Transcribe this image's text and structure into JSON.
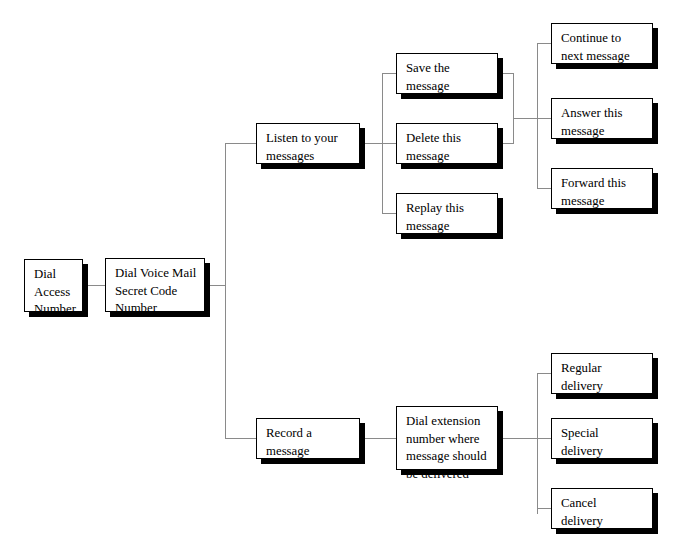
{
  "diagram": {
    "type": "flowchart",
    "orientation": "left-to-right",
    "box_fill_color": "#ffffff",
    "box_border_color": "#000000",
    "shadow_color": "#000000",
    "connector_color": "#8a8a8a",
    "text_color": "#000000"
  },
  "nodes": [
    {
      "id": "dial-access-number",
      "label": "Dial\nAccess\nNumber",
      "x": 24,
      "y": 259,
      "w": 59,
      "h": 53,
      "level": 0
    },
    {
      "id": "dial-secret-code",
      "label": "Dial Voice Mail\nSecret Code\nNumber",
      "x": 105,
      "y": 258,
      "w": 100,
      "h": 54,
      "level": 1
    },
    {
      "id": "listen-messages",
      "label": "Listen to your\nmessages",
      "x": 256,
      "y": 123,
      "w": 104,
      "h": 41,
      "level": 2
    },
    {
      "id": "record-message",
      "label": "Record a\nmessage",
      "x": 256,
      "y": 418,
      "w": 104,
      "h": 41,
      "level": 2
    },
    {
      "id": "save-message",
      "label": "Save the\nmessage",
      "x": 396,
      "y": 53,
      "w": 102,
      "h": 41,
      "level": 3
    },
    {
      "id": "delete-message",
      "label": "Delete this\nmessage",
      "x": 396,
      "y": 123,
      "w": 102,
      "h": 41,
      "level": 3
    },
    {
      "id": "replay-message",
      "label": "Replay this\nmessage",
      "x": 396,
      "y": 193,
      "w": 102,
      "h": 41,
      "level": 3
    },
    {
      "id": "dial-extension",
      "label": "Dial extension\nnumber where\nmessage should\nbe delivered",
      "x": 396,
      "y": 406,
      "w": 102,
      "h": 64,
      "level": 3
    },
    {
      "id": "continue-next",
      "label": "Continue to\nnext message",
      "x": 551,
      "y": 23,
      "w": 102,
      "h": 41,
      "level": 4
    },
    {
      "id": "answer-message",
      "label": "Answer this\nmessage",
      "x": 551,
      "y": 98,
      "w": 102,
      "h": 41,
      "level": 4
    },
    {
      "id": "forward-message",
      "label": "Forward this\nmessage",
      "x": 551,
      "y": 168,
      "w": 102,
      "h": 41,
      "level": 4
    },
    {
      "id": "regular-delivery",
      "label": "Regular\ndelivery",
      "x": 551,
      "y": 353,
      "w": 102,
      "h": 41,
      "level": 4
    },
    {
      "id": "special-delivery",
      "label": "Special\ndelivery",
      "x": 551,
      "y": 418,
      "w": 102,
      "h": 41,
      "level": 4
    },
    {
      "id": "cancel-delivery",
      "label": "Cancel\ndelivery",
      "x": 551,
      "y": 488,
      "w": 102,
      "h": 41,
      "level": 4
    }
  ],
  "connectors": [
    {
      "id": "c-access-to-secret",
      "type": "h",
      "x": 83,
      "y": 285,
      "len": 22
    },
    {
      "id": "c-secret-stub",
      "type": "h",
      "x": 205,
      "y": 285,
      "len": 21
    },
    {
      "id": "c-spine-main",
      "type": "v",
      "x": 225,
      "y": 143,
      "len": 296
    },
    {
      "id": "c-spine-to-listen",
      "type": "h",
      "x": 225,
      "y": 143,
      "len": 31
    },
    {
      "id": "c-spine-to-record",
      "type": "h",
      "x": 225,
      "y": 438,
      "len": 31
    },
    {
      "id": "c-listen-stub",
      "type": "h",
      "x": 360,
      "y": 143,
      "len": 23
    },
    {
      "id": "c-trunk-listen-children",
      "type": "v",
      "x": 382,
      "y": 73,
      "len": 141
    },
    {
      "id": "c-to-save",
      "type": "h",
      "x": 382,
      "y": 73,
      "len": 14
    },
    {
      "id": "c-to-delete",
      "type": "h",
      "x": 382,
      "y": 143,
      "len": 14
    },
    {
      "id": "c-to-replay",
      "type": "h",
      "x": 382,
      "y": 213,
      "len": 14
    },
    {
      "id": "c-save-stub",
      "type": "h",
      "x": 498,
      "y": 73,
      "len": 15
    },
    {
      "id": "c-delete-stub",
      "type": "h",
      "x": 498,
      "y": 143,
      "len": 15
    },
    {
      "id": "c-join-save-delete",
      "type": "v",
      "x": 513,
      "y": 73,
      "len": 71
    },
    {
      "id": "c-join-to-trunk",
      "type": "h",
      "x": 513,
      "y": 118,
      "len": 25
    },
    {
      "id": "c-trunk-actions",
      "type": "v",
      "x": 537,
      "y": 43,
      "len": 146
    },
    {
      "id": "c-to-continue",
      "type": "h",
      "x": 537,
      "y": 43,
      "len": 15
    },
    {
      "id": "c-to-answer",
      "type": "h",
      "x": 537,
      "y": 118,
      "len": 15
    },
    {
      "id": "c-to-forward",
      "type": "h",
      "x": 537,
      "y": 188,
      "len": 15
    },
    {
      "id": "c-record-stub",
      "type": "h",
      "x": 360,
      "y": 438,
      "len": 37
    },
    {
      "id": "c-extension-stub",
      "type": "h",
      "x": 498,
      "y": 438,
      "len": 40
    },
    {
      "id": "c-trunk-delivery",
      "type": "v",
      "x": 537,
      "y": 373,
      "len": 141
    },
    {
      "id": "c-to-regular",
      "type": "h",
      "x": 537,
      "y": 373,
      "len": 15
    },
    {
      "id": "c-to-special",
      "type": "h",
      "x": 537,
      "y": 438,
      "len": 15
    },
    {
      "id": "c-to-cancel",
      "type": "h",
      "x": 537,
      "y": 508,
      "len": 15
    }
  ]
}
